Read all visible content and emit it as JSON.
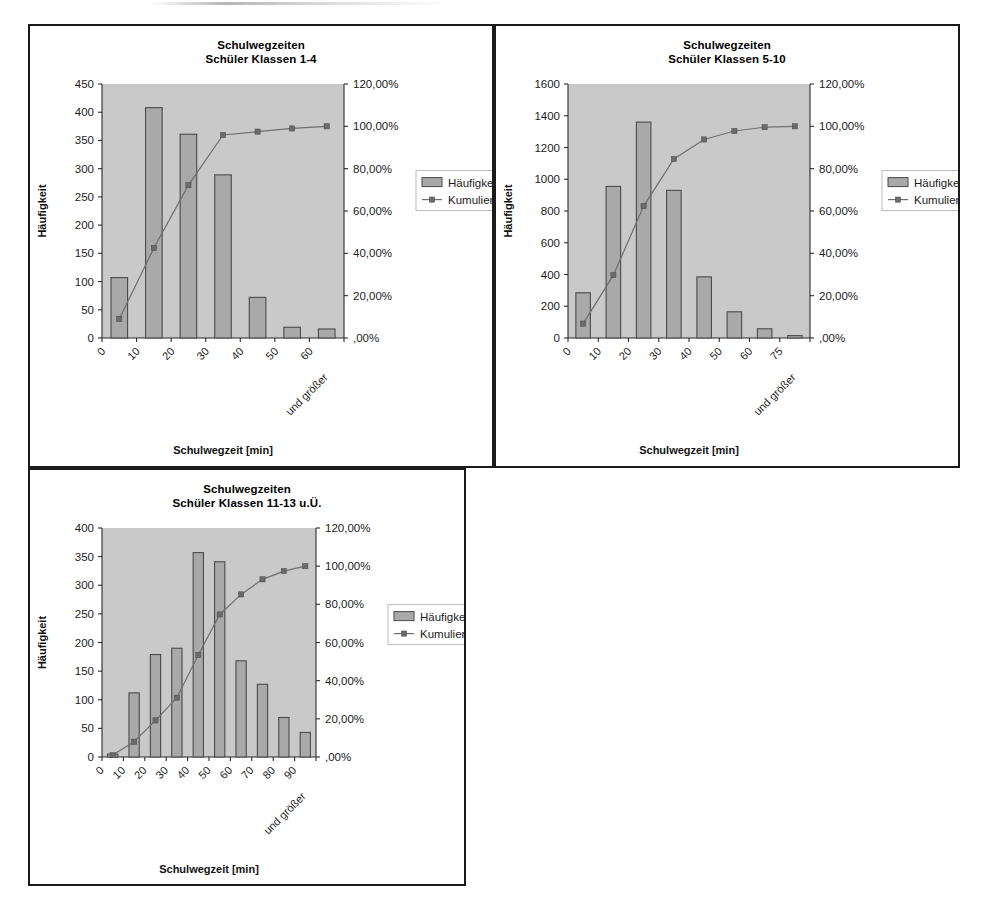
{
  "page": {
    "background": "#ffffff",
    "panel_border_color": "#1a1a1a",
    "plot_bg_color": "#c9c9c9",
    "bar_color": "#a9a9a9",
    "line_color": "#6e6e6e"
  },
  "legend": {
    "bar_label": "Häufigkeit",
    "line_label": "Kumuliert %"
  },
  "axes": {
    "ylabel": "Häufigkeit",
    "xlabel": "Schulwegzeit [min]",
    "pct_ticks": [
      ",00%",
      "20,00%",
      "40,00%",
      "60,00%",
      "80,00%",
      "100,00%",
      "120,00%"
    ],
    "pct_max": 120
  },
  "chart_data": [
    {
      "id": "chart-1",
      "type": "bar",
      "title": "Schulwegzeiten",
      "subtitle": "Schüler Klassen 1-4",
      "xlabel": "Schulwegzeit [min]",
      "ylabel": "Häufigkeit",
      "categories": [
        "0",
        "10",
        "20",
        "30",
        "40",
        "50",
        "60",
        "und größer"
      ],
      "tilted_last_label": "und größer",
      "values": [
        107,
        408,
        361,
        289,
        72,
        19,
        16
      ],
      "cumulative_pct": [
        9.0,
        42.5,
        72.2,
        95.9,
        97.5,
        99.0,
        100.0
      ],
      "ylim": [
        0,
        450
      ],
      "yticks": [
        0,
        50,
        100,
        150,
        200,
        250,
        300,
        350,
        400,
        450
      ],
      "ytick_labels": [
        "0",
        "50",
        "100",
        "150",
        "200",
        "250",
        "300",
        "350",
        "400",
        "450"
      ],
      "y2lim": [
        0,
        120
      ],
      "y2ticks": [
        0,
        20,
        40,
        60,
        80,
        100,
        120
      ],
      "y2tick_labels": [
        ",00%",
        "20,00%",
        "40,00%",
        "60,00%",
        "80,00%",
        "100,00%",
        "120,00%"
      ],
      "grid": false,
      "legend_position": "right",
      "series": [
        {
          "name": "Häufigkeit",
          "type": "bar",
          "values": [
            107,
            408,
            361,
            289,
            72,
            19,
            16
          ]
        },
        {
          "name": "Kumuliert %",
          "type": "line",
          "values": [
            9.0,
            42.5,
            72.2,
            95.9,
            97.5,
            99.0,
            100.0
          ]
        }
      ]
    },
    {
      "id": "chart-2",
      "type": "bar",
      "title": "Schulwegzeiten",
      "subtitle": "Schüler Klassen 5-10",
      "xlabel": "Schulwegzeit [min]",
      "ylabel": "Häufigkeit",
      "categories": [
        "0",
        "10",
        "20",
        "30",
        "40",
        "50",
        "60",
        "75",
        "und größer"
      ],
      "tilted_last_label": "und größer",
      "values": [
        285,
        955,
        1360,
        930,
        385,
        165,
        58,
        15
      ],
      "cumulative_pct": [
        6.8,
        29.7,
        62.3,
        84.6,
        93.8,
        97.8,
        99.6,
        100.0
      ],
      "ylim": [
        0,
        1600
      ],
      "yticks": [
        0,
        200,
        400,
        600,
        800,
        1000,
        1200,
        1400,
        1600
      ],
      "ytick_labels": [
        "0",
        "200",
        "400",
        "600",
        "800",
        "1000",
        "1200",
        "1400",
        "1600"
      ],
      "y2lim": [
        0,
        120
      ],
      "y2ticks": [
        0,
        20,
        40,
        60,
        80,
        100,
        120
      ],
      "y2tick_labels": [
        ",00%",
        "20,00%",
        "40,00%",
        "60,00%",
        "80,00%",
        "100,00%",
        "120,00%"
      ],
      "grid": false,
      "legend_position": "right",
      "series": [
        {
          "name": "Häufigkeit",
          "type": "bar",
          "values": [
            285,
            955,
            1360,
            930,
            385,
            165,
            58,
            15
          ]
        },
        {
          "name": "Kumuliert %",
          "type": "line",
          "values": [
            6.8,
            29.7,
            62.3,
            84.6,
            93.8,
            97.8,
            99.6,
            100.0
          ]
        }
      ]
    },
    {
      "id": "chart-3",
      "type": "bar",
      "title": "Schulwegzeiten",
      "subtitle": "Schüler Klassen 11-13 u.Ü.",
      "xlabel": "Schulwegzeit [min]",
      "ylabel": "Häufigkeit",
      "categories": [
        "0",
        "10",
        "20",
        "30",
        "40",
        "50",
        "60",
        "70",
        "80",
        "90",
        "und größer"
      ],
      "tilted_last_label": "und größer",
      "values": [
        5,
        112,
        179,
        190,
        357,
        341,
        168,
        127,
        69,
        43
      ],
      "cumulative_pct": [
        1.0,
        8.0,
        19.2,
        31.1,
        53.4,
        74.7,
        85.2,
        93.1,
        97.4,
        100.0
      ],
      "ylim": [
        0,
        400
      ],
      "yticks": [
        0,
        50,
        100,
        150,
        200,
        250,
        300,
        350,
        400
      ],
      "ytick_labels": [
        "0",
        "50",
        "100",
        "150",
        "200",
        "250",
        "300",
        "350",
        "400"
      ],
      "y2lim": [
        0,
        120
      ],
      "y2ticks": [
        0,
        20,
        40,
        60,
        80,
        100,
        120
      ],
      "y2tick_labels": [
        ",00%",
        "20,00%",
        "40,00%",
        "60,00%",
        "80,00%",
        "100,00%",
        "120,00%"
      ],
      "grid": false,
      "legend_position": "right",
      "series": [
        {
          "name": "Häufigkeit",
          "type": "bar",
          "values": [
            5,
            112,
            179,
            190,
            357,
            341,
            168,
            127,
            69,
            43
          ]
        },
        {
          "name": "Kumuliert %",
          "type": "line",
          "values": [
            1.0,
            8.0,
            19.2,
            31.1,
            53.4,
            74.7,
            85.2,
            93.1,
            97.4,
            100.0
          ]
        }
      ]
    }
  ]
}
